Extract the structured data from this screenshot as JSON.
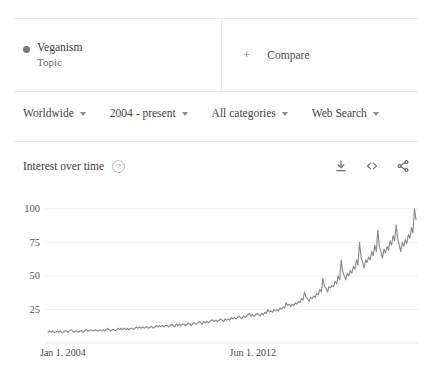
{
  "chip": {
    "term": "Veganism",
    "type": "Topic",
    "dot_color": "#7a7a7a",
    "compare_plus": "+",
    "compare_label": "Compare"
  },
  "filters": [
    {
      "label": "Worldwide",
      "icon": "chevron-down-icon"
    },
    {
      "label": "2004 - present",
      "icon": "chevron-down-icon"
    },
    {
      "label": "All categories",
      "icon": "chevron-down-icon"
    },
    {
      "label": "Web Search",
      "icon": "chevron-down-icon"
    }
  ],
  "chart_header": {
    "title": "Interest over time",
    "help_glyph": "?",
    "actions": [
      {
        "name": "download-icon"
      },
      {
        "name": "embed-icon"
      },
      {
        "name": "share-icon"
      }
    ]
  },
  "chart_data": {
    "type": "line",
    "title": "Interest over time",
    "xlabel": "",
    "ylabel": "",
    "ylim": [
      0,
      105
    ],
    "yticks": [
      25,
      50,
      75,
      100
    ],
    "grid": true,
    "legend": "none",
    "line_color": "#8b8b8b",
    "xtick_labels": [
      "Jan 1, 2004",
      "Jun 1, 2012"
    ],
    "xtick_positions": [
      0,
      0.515
    ],
    "series": [
      {
        "name": "Veganism",
        "values": [
          8,
          9,
          8,
          9,
          8,
          8,
          9,
          8,
          9,
          8,
          8,
          9,
          9,
          8,
          9,
          10,
          9,
          8,
          9,
          9,
          8,
          9,
          9,
          8,
          9,
          10,
          9,
          9,
          10,
          9,
          9,
          10,
          9,
          9,
          10,
          9,
          10,
          9,
          10,
          11,
          10,
          9,
          10,
          10,
          9,
          10,
          11,
          10,
          11,
          10,
          11,
          10,
          11,
          10,
          11,
          11,
          10,
          11,
          12,
          11,
          12,
          11,
          12,
          11,
          12,
          12,
          11,
          12,
          12,
          11,
          12,
          13,
          12,
          13,
          12,
          13,
          12,
          13,
          13,
          12,
          13,
          14,
          13,
          12,
          14,
          13,
          14,
          13,
          14,
          14,
          13,
          14,
          15,
          14,
          13,
          15,
          15,
          14,
          15,
          16,
          15,
          14,
          16,
          15,
          16,
          15,
          16,
          17,
          17,
          16,
          17,
          16,
          17,
          18,
          17,
          16,
          18,
          17,
          18,
          17,
          19,
          18,
          19,
          18,
          19,
          20,
          19,
          18,
          20,
          19,
          20,
          21,
          22,
          20,
          21,
          20,
          21,
          22,
          21,
          20,
          22,
          21,
          23,
          22,
          25,
          23,
          24,
          23,
          25,
          24,
          25,
          24,
          26,
          25,
          27,
          26,
          30,
          28,
          29,
          27,
          29,
          28,
          30,
          29,
          31,
          30,
          33,
          32,
          38,
          34,
          33,
          31,
          34,
          33,
          35,
          34,
          37,
          36,
          40,
          38,
          48,
          42,
          41,
          38,
          42,
          41,
          43,
          42,
          46,
          44,
          50,
          47,
          62,
          53,
          50,
          47,
          52,
          50,
          54,
          52,
          57,
          55,
          62,
          58,
          75,
          64,
          60,
          56,
          62,
          60,
          64,
          62,
          68,
          65,
          73,
          68,
          84,
          72,
          68,
          63,
          70,
          67,
          72,
          69,
          76,
          73,
          80,
          76,
          88,
          78,
          73,
          68,
          75,
          72,
          77,
          74,
          81,
          78,
          86,
          82,
          100,
          92
        ]
      }
    ]
  }
}
